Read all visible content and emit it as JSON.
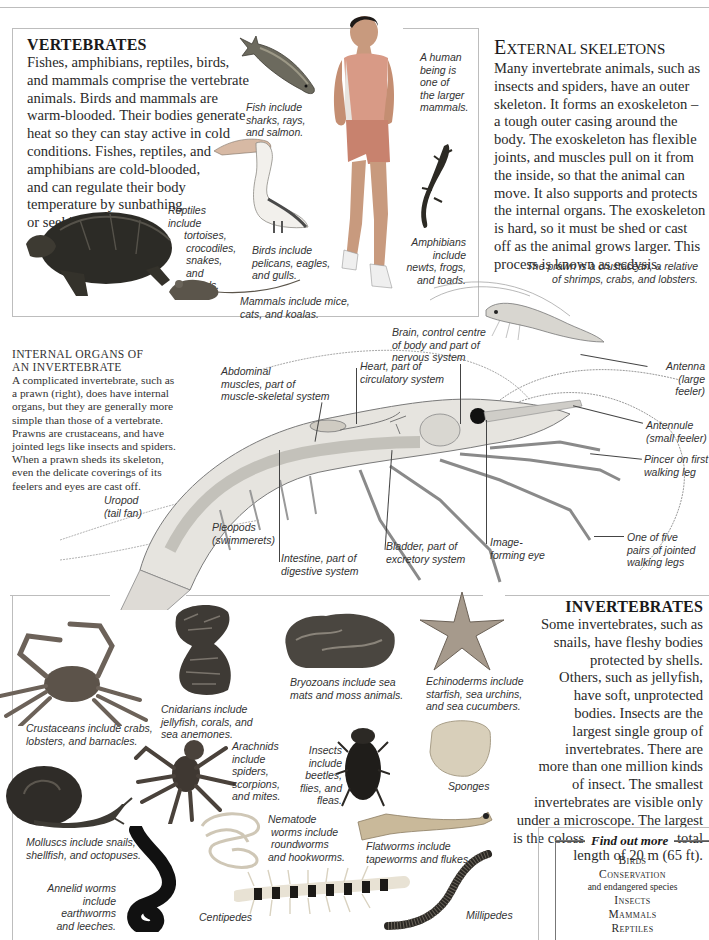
{
  "page": {
    "vertebrates": {
      "heading": "VERTEBRATES",
      "lines": [
        "Fishes, amphibians, reptiles, birds,",
        "and mammals comprise the vertebrate",
        "animals. Birds and mammals are",
        "warm-blooded. Their bodies generate",
        "heat so they can stay active in cold",
        "conditions. Fishes, reptiles, and",
        "amphibians are cold-blooded,",
        "and can regulate their body",
        "temperature by sunbathing",
        "or seeking shade."
      ],
      "captions": {
        "fish": [
          "Fish include",
          "sharks, rays,",
          "and salmon."
        ],
        "human": [
          "A human",
          "being is",
          "one of",
          "the larger",
          "mammals."
        ],
        "reptiles": [
          "Reptiles include",
          "tortoises,",
          "crocodiles,",
          "snakes, and",
          "lizards."
        ],
        "birds": [
          "Birds include",
          "pelicans, eagles,",
          "and gulls."
        ],
        "amphibians": [
          "Amphibians",
          "include",
          "newts, frogs,",
          "and toads."
        ],
        "mammals": [
          "Mammals include mice,",
          "cats, and koalas."
        ]
      }
    },
    "external_skeletons": {
      "heading_first": "E",
      "heading_rest": "XTERNAL SKELETONS",
      "lines": [
        "Many invertebrate animals, such as",
        "insects and spiders, have an outer",
        "skeleton. It forms an exoskeleton –",
        "a tough outer casing around the",
        "body. The exoskeleton has flexible",
        "joints, and muscles pull on it from",
        "the inside, so that the animal can",
        "move. It also supports and protects",
        "the internal organs. The exoskeleton",
        "is hard, so it must be shed or cast",
        "off as the animal grows larger. This",
        "process is known as ecdysis."
      ],
      "prawn_caption": [
        "The prawn is a crustacean, a relative",
        "of shrimps, crabs, and lobsters."
      ]
    },
    "internal_organs": {
      "title_lines": [
        "INTERNAL ORGANS OF",
        "AN INVERTEBRATE"
      ],
      "lines": [
        "A complicated invertebrate, such as",
        "a prawn (right), does have internal",
        "organs, but they are generally more",
        "simple than those of a vertebrate.",
        "Prawns are crustaceans, and have",
        "jointed legs like insects and spiders.",
        "When a prawn sheds its skeleton,",
        "even the delicate coverings of its",
        "feelers and eyes are cast off."
      ],
      "labels": {
        "brain": [
          "Brain, control centre",
          "of body and part of",
          "nervous system"
        ],
        "heart": [
          "Heart, part of",
          "circulatory system"
        ],
        "abdominal": [
          "Abdominal",
          "muscles, part of",
          "muscle-skeletal system"
        ],
        "antenna": [
          "Antenna",
          "(large feeler)"
        ],
        "antennule": [
          "Antennule",
          "(small feeler)"
        ],
        "pincer": [
          "Pincer on first",
          "walking leg"
        ],
        "walking_legs": [
          "One of five",
          "pairs of jointed",
          "walking legs"
        ],
        "uropod": [
          "Uropod",
          "(tail fan)"
        ],
        "pleopods": [
          "Pleopods",
          "(swimmerets)"
        ],
        "intestine": [
          "Intestine, part of",
          "digestive system"
        ],
        "bladder": [
          "Bladder, part of",
          "excretory system"
        ],
        "eye": [
          "Image-",
          "forming eye"
        ]
      }
    },
    "invertebrates": {
      "heading": "INVERTEBRATES",
      "lines": [
        "Some invertebrates, such as",
        "snails, have fleshy bodies",
        "protected by shells.",
        "Others, such as jellyfish,",
        "have soft, unprotected",
        "bodies. Insects are the",
        "largest single group of",
        "invertebrates. There are",
        "more than one million kinds",
        "of insect. The smallest",
        "invertebrates are visible only",
        "under a microscope. The largest",
        "is the colossal squid, with a total",
        "length of 20 m (65 ft)."
      ],
      "captions": {
        "crustaceans": [
          "Crustaceans include crabs,",
          "lobsters, and barnacles."
        ],
        "cnidarians": [
          "Cnidarians include",
          "jellyfish, corals, and",
          "sea anemones."
        ],
        "bryozoans": [
          "Bryozoans include sea",
          "mats and moss animals."
        ],
        "echinoderms": [
          "Echinoderms include",
          "starfish, sea urchins,",
          "and sea cucumbers."
        ],
        "arachnids": [
          "Arachnids",
          "include",
          "spiders,",
          "scorpions,",
          "and mites."
        ],
        "insects": [
          "Insects",
          "include",
          "beetles,",
          "flies, and",
          "fleas."
        ],
        "sponges": [
          "Sponges"
        ],
        "molluscs": [
          "Molluscs include snails,",
          "shellfish, and octopuses."
        ],
        "nematodes": [
          "Nematode",
          "worms include",
          "roundworms",
          "and hookworms."
        ],
        "flatworms": [
          "Flatworms include",
          "tapeworms and flukes."
        ],
        "annelids": [
          "Annelid worms",
          "include earthworms",
          "and leeches."
        ],
        "centipedes": [
          "Centipedes"
        ],
        "millipedes": [
          "Millipedes"
        ]
      }
    },
    "find_out_more": {
      "title": "Find out more",
      "links": [
        {
          "label": "Birds"
        },
        {
          "label": "Conservation",
          "sub": "and endangered species"
        },
        {
          "label": "Insects"
        },
        {
          "label": "Mammals"
        },
        {
          "label": "Reptiles"
        }
      ]
    }
  }
}
